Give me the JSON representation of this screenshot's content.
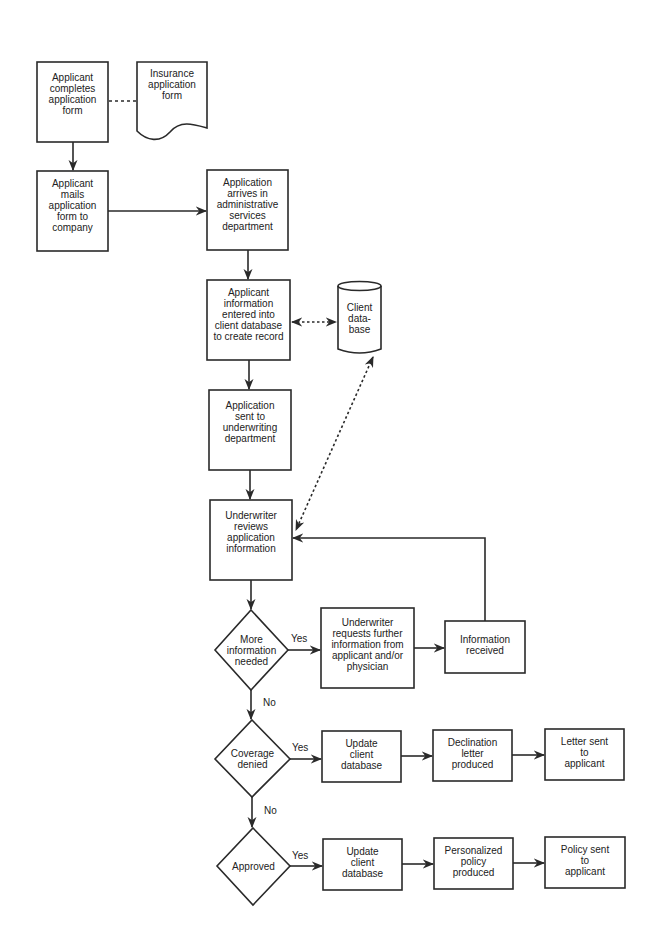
{
  "diagram": {
    "type": "flowchart",
    "nodes": {
      "completes": {
        "label": "Applicant\ncompletes\napplication\nform",
        "shape": "process"
      },
      "form_doc": {
        "label": "Insurance\napplication\nform",
        "shape": "document"
      },
      "mails": {
        "label": "Applicant\nmails\napplication\nform to\ncompany",
        "shape": "process"
      },
      "arrives": {
        "label": "Application\narrives in\nadministrative\nservices\ndepartment",
        "shape": "process"
      },
      "entered": {
        "label": "Applicant\ninformation\nentered into\nclient database\nto create record",
        "shape": "process"
      },
      "client_db": {
        "label": "Client\ndata-\nbase",
        "shape": "database"
      },
      "sent_uw": {
        "label": "Application\nsent to\nunderwriting\ndepartment",
        "shape": "process"
      },
      "uw_reviews": {
        "label": "Underwriter\nreviews\napplication\ninformation",
        "shape": "process"
      },
      "more_info": {
        "label": "More\ninformation\nneeded",
        "shape": "decision"
      },
      "uw_requests": {
        "label": "Underwriter\nrequests further\ninformation from\napplicant and/or\nphysician",
        "shape": "process"
      },
      "info_received": {
        "label": "Information\nreceived",
        "shape": "process"
      },
      "coverage_denied": {
        "label": "Coverage\ndenied",
        "shape": "decision"
      },
      "update_db_1": {
        "label": "Update\nclient\ndatabase",
        "shape": "process"
      },
      "declination": {
        "label": "Declination\nletter\nproduced",
        "shape": "process"
      },
      "letter_sent": {
        "label": "Letter sent\nto\napplicant",
        "shape": "process"
      },
      "approved": {
        "label": "Approved",
        "shape": "decision"
      },
      "update_db_2": {
        "label": "Update\nclient\ndatabase",
        "shape": "process"
      },
      "personalized": {
        "label": "Personalized\npolicy\nproduced",
        "shape": "process"
      },
      "policy_sent": {
        "label": "Policy sent\nto\napplicant",
        "shape": "process"
      }
    },
    "edge_labels": {
      "yes": "Yes",
      "no": "No"
    },
    "edges": [
      {
        "from": "completes",
        "to": "form_doc",
        "style": "dashed",
        "arrow": "none"
      },
      {
        "from": "completes",
        "to": "mails"
      },
      {
        "from": "mails",
        "to": "arrives"
      },
      {
        "from": "arrives",
        "to": "entered"
      },
      {
        "from": "entered",
        "to": "client_db",
        "style": "dotted",
        "arrow": "both"
      },
      {
        "from": "entered",
        "to": "sent_uw"
      },
      {
        "from": "client_db",
        "to": "uw_reviews",
        "style": "dotted",
        "arrow": "both"
      },
      {
        "from": "sent_uw",
        "to": "uw_reviews"
      },
      {
        "from": "uw_reviews",
        "to": "more_info"
      },
      {
        "from": "more_info",
        "to": "uw_requests",
        "label": "Yes"
      },
      {
        "from": "uw_requests",
        "to": "info_received"
      },
      {
        "from": "info_received",
        "to": "uw_reviews"
      },
      {
        "from": "more_info",
        "to": "coverage_denied",
        "label": "No"
      },
      {
        "from": "coverage_denied",
        "to": "update_db_1",
        "label": "Yes"
      },
      {
        "from": "update_db_1",
        "to": "declination"
      },
      {
        "from": "declination",
        "to": "letter_sent"
      },
      {
        "from": "coverage_denied",
        "to": "approved",
        "label": "No"
      },
      {
        "from": "approved",
        "to": "update_db_2",
        "label": "Yes"
      },
      {
        "from": "update_db_2",
        "to": "personalized"
      },
      {
        "from": "personalized",
        "to": "policy_sent"
      }
    ]
  },
  "colors": {
    "stroke": "#2a2a2a",
    "text": "#222222",
    "background": "#ffffff"
  }
}
